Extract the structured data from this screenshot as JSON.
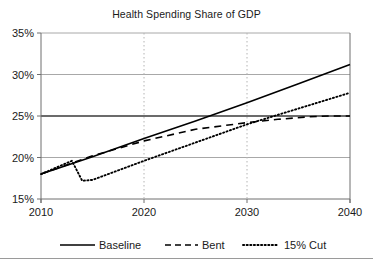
{
  "chart_data": {
    "type": "line",
    "title": "Health Spending Share of GDP",
    "xlabel": "",
    "ylabel": "",
    "xlim": [
      2010,
      2040
    ],
    "ylim": [
      15,
      35
    ],
    "x_ticks": [
      2010,
      2020,
      2030,
      2040
    ],
    "x_tick_labels": [
      "2010",
      "2020",
      "2030",
      "2040"
    ],
    "y_ticks": [
      15,
      20,
      25,
      30,
      35
    ],
    "y_tick_labels": [
      "15%",
      "20%",
      "25%",
      "30%",
      "35%"
    ],
    "grid": "horizontal solid gray, vertical dotted gray at 2020 and 2030",
    "legend_position": "below plot, horizontal",
    "series": [
      {
        "name": "Baseline",
        "style": "solid",
        "color": "#000000",
        "x": [
          2010,
          2015,
          2020,
          2025,
          2030,
          2035,
          2040
        ],
        "values": [
          18.0,
          20.1,
          22.3,
          24.4,
          26.6,
          28.9,
          31.2
        ]
      },
      {
        "name": "Bent",
        "style": "dashed",
        "color": "#000000",
        "x": [
          2010,
          2015,
          2020,
          2025,
          2030,
          2033,
          2036,
          2038,
          2040
        ],
        "values": [
          18.0,
          20.2,
          22.0,
          23.4,
          24.2,
          24.6,
          24.9,
          25.0,
          25.0
        ]
      },
      {
        "name": "15% Cut",
        "style": "dotted",
        "color": "#000000",
        "x": [
          2010,
          2013,
          2014,
          2015,
          2020,
          2025,
          2030,
          2035,
          2040
        ],
        "values": [
          18.0,
          19.6,
          17.2,
          17.3,
          19.6,
          21.8,
          24.0,
          25.9,
          27.8
        ]
      }
    ],
    "annotations": []
  },
  "legend": {
    "items": [
      {
        "label": "Baseline",
        "style": "solid"
      },
      {
        "label": "Bent",
        "style": "dashed"
      },
      {
        "label": "15% Cut",
        "style": "dotted"
      }
    ]
  },
  "colors": {
    "line": "#000000",
    "grid_horizontal": "#a8a8a8",
    "grid_vertical": "#b4b4b4",
    "axis": "#6e6e6e",
    "text": "#1a1a1a",
    "background": "#ffffff",
    "bottom_rule": "#9a9a9a"
  }
}
